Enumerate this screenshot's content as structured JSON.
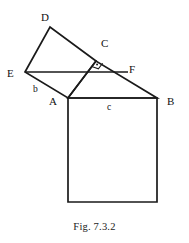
{
  "figure": {
    "caption": "Fig. 7.3.2",
    "background_color": "#ffffff",
    "stroke_color": "#1a1a1a",
    "label_color": "#111111"
  },
  "vertex_labels": [
    {
      "id": "D",
      "text": "D",
      "x": 41,
      "y": 12
    },
    {
      "id": "C",
      "text": "C",
      "x": 101,
      "y": 38
    },
    {
      "id": "E",
      "text": "E",
      "x": 7,
      "y": 68
    },
    {
      "id": "F",
      "text": "F",
      "x": 129,
      "y": 64
    },
    {
      "id": "A",
      "text": "A",
      "x": 49,
      "y": 96
    },
    {
      "id": "B",
      "text": "B",
      "x": 167,
      "y": 96
    }
  ],
  "side_labels": [
    {
      "id": "b",
      "text": "b",
      "x": 33,
      "y": 84
    },
    {
      "id": "c",
      "text": "c",
      "x": 107,
      "y": 102
    }
  ],
  "geometry": {
    "points": {
      "A": {
        "x": 68,
        "y": 98
      },
      "B": {
        "x": 157,
        "y": 98
      },
      "C": {
        "x": 96,
        "y": 61
      },
      "D": {
        "x": 50,
        "y": 27
      },
      "E": {
        "x": 25,
        "y": 72
      },
      "F": {
        "x": 128,
        "y": 72
      },
      "Bb": {
        "x": 157,
        "y": 202
      },
      "Ab": {
        "x": 68,
        "y": 202
      }
    },
    "square_on_c": [
      "A",
      "B",
      "Bb",
      "Ab"
    ],
    "square_on_b": [
      "E",
      "D",
      "C",
      "A"
    ],
    "triangle": [
      "A",
      "B",
      "C"
    ],
    "segment_EF": [
      "E",
      "F"
    ],
    "right_angle_at": "C"
  },
  "marks": {
    "right_angle": {
      "name": "right-angle-mark",
      "vertex": "C",
      "size": 7
    }
  }
}
